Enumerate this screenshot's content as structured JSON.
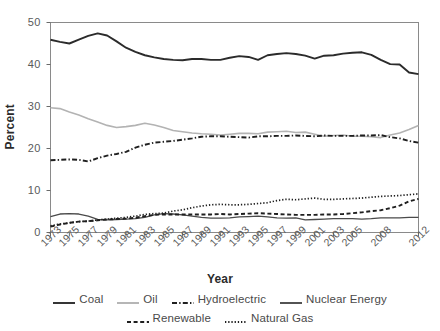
{
  "chart_data": {
    "type": "line",
    "title": "",
    "xlabel": "Year",
    "ylabel": "Percent",
    "xlim": [
      1973,
      2012
    ],
    "ylim": [
      0,
      50
    ],
    "ytick_values": [
      0,
      10,
      20,
      30,
      40,
      50
    ],
    "ytick_labels": [
      "0",
      "10",
      "20",
      "30",
      "40",
      "50"
    ],
    "xtick_labels": [
      "1973",
      "1975",
      "1977",
      "1979",
      "1981",
      "1983",
      "1985",
      "1987",
      "1989",
      "1991",
      "1993",
      "1995",
      "1997",
      "1999",
      "2001",
      "2003",
      "2005",
      "2008",
      "2012"
    ],
    "xtick_values": [
      1973,
      1975,
      1977,
      1979,
      1981,
      1983,
      1985,
      1987,
      1989,
      1991,
      1993,
      1995,
      1997,
      1999,
      2001,
      2003,
      2005,
      2008,
      2012
    ],
    "x": [
      1973,
      1974,
      1975,
      1976,
      1977,
      1978,
      1979,
      1980,
      1981,
      1982,
      1983,
      1984,
      1985,
      1986,
      1987,
      1988,
      1989,
      1990,
      1991,
      1992,
      1993,
      1994,
      1995,
      1996,
      1997,
      1998,
      1999,
      2000,
      2001,
      2002,
      2003,
      2004,
      2005,
      2006,
      2007,
      2008,
      2009,
      2010,
      2011,
      2012
    ],
    "grid": false,
    "legend_position": "bottom",
    "series": [
      {
        "name": "Coal",
        "style": "solid",
        "color": "#2b2b2b",
        "width": 1.9,
        "values": [
          45.9,
          45.4,
          45.0,
          45.9,
          46.8,
          47.4,
          46.9,
          45.5,
          44.0,
          43.0,
          42.2,
          41.7,
          41.3,
          41.1,
          41.0,
          41.3,
          41.3,
          41.1,
          41.1,
          41.6,
          42.0,
          41.8,
          41.1,
          42.2,
          42.5,
          42.7,
          42.5,
          42.1,
          41.4,
          42.1,
          42.2,
          42.6,
          42.8,
          42.9,
          42.3,
          41.1,
          40.1,
          40.0,
          38.1,
          37.7
        ]
      },
      {
        "name": "Oil",
        "style": "solid",
        "color": "#b3b3b3",
        "width": 1.6,
        "values": [
          29.7,
          29.5,
          28.7,
          28.0,
          27.1,
          26.3,
          25.5,
          25.0,
          25.2,
          25.5,
          26.0,
          25.6,
          25.0,
          24.3,
          24.0,
          23.7,
          23.5,
          23.4,
          23.2,
          23.4,
          23.6,
          23.6,
          23.5,
          23.9,
          24.0,
          24.1,
          23.8,
          23.9,
          23.4,
          22.9,
          23.1,
          23.2,
          22.9,
          22.9,
          22.8,
          22.6,
          23.2,
          23.7,
          24.5,
          25.5
        ]
      },
      {
        "name": "Hydroelectric",
        "style": "dashdot",
        "color": "#1f1f1f",
        "width": 1.9,
        "values": [
          17.2,
          17.3,
          17.4,
          17.3,
          16.9,
          17.7,
          18.3,
          18.7,
          19.2,
          20.2,
          20.9,
          21.4,
          21.6,
          21.8,
          22.1,
          22.4,
          22.8,
          22.9,
          22.9,
          22.8,
          22.7,
          22.6,
          22.9,
          22.9,
          23.0,
          23.0,
          23.1,
          23.0,
          22.9,
          23.1,
          23.0,
          23.0,
          23.0,
          23.1,
          23.1,
          23.2,
          22.7,
          22.4,
          21.8,
          21.4
        ]
      },
      {
        "name": "Nuclear Energy",
        "style": "solid",
        "color": "#4a4a4a",
        "width": 1.3,
        "values": [
          3.8,
          4.4,
          4.5,
          4.4,
          3.9,
          3.1,
          3.0,
          3.1,
          3.2,
          3.3,
          3.6,
          4.2,
          4.5,
          4.4,
          4.2,
          3.9,
          3.6,
          3.4,
          3.4,
          3.5,
          3.7,
          3.8,
          3.9,
          3.7,
          3.5,
          3.4,
          3.5,
          3.0,
          3.1,
          3.2,
          3.3,
          3.3,
          3.3,
          3.2,
          3.3,
          3.5,
          3.5,
          3.5,
          3.6,
          3.6
        ]
      },
      {
        "name": "Renewable",
        "style": "dashed",
        "color": "#1f1f1f",
        "width": 1.9,
        "values": [
          1.4,
          1.9,
          2.3,
          2.6,
          2.7,
          2.9,
          3.1,
          3.2,
          3.3,
          3.5,
          3.9,
          4.2,
          4.3,
          4.3,
          4.3,
          4.3,
          4.3,
          4.3,
          4.4,
          4.3,
          4.4,
          4.5,
          4.6,
          4.5,
          4.4,
          4.3,
          4.2,
          4.2,
          4.2,
          4.3,
          4.3,
          4.4,
          4.6,
          4.8,
          5.1,
          5.3,
          5.8,
          6.4,
          7.4,
          8.0
        ]
      },
      {
        "name": "Natural Gas",
        "style": "dotted",
        "color": "#1f1f1f",
        "width": 1.7,
        "values": [
          1.6,
          2.0,
          2.3,
          2.6,
          2.7,
          3.0,
          3.2,
          3.4,
          3.6,
          3.9,
          4.3,
          4.5,
          4.6,
          5.1,
          5.4,
          5.9,
          6.3,
          6.6,
          6.7,
          6.6,
          6.6,
          6.7,
          6.9,
          7.1,
          7.6,
          7.9,
          7.8,
          8.0,
          8.2,
          7.9,
          7.9,
          8.0,
          8.1,
          8.2,
          8.4,
          8.6,
          8.7,
          8.8,
          9.0,
          9.2
        ]
      }
    ]
  },
  "axes": {
    "ylabel": "Percent",
    "xlabel": "Year"
  },
  "legend": {
    "row1": [
      {
        "label": "Coal",
        "style": "solid",
        "color": "#2b2b2b"
      },
      {
        "label": "Oil",
        "style": "solid",
        "color": "#b3b3b3"
      },
      {
        "label": "Hydroelectric",
        "style": "dashdot",
        "color": "#1f1f1f"
      },
      {
        "label": "Nuclear Energy",
        "style": "solid",
        "color": "#4a4a4a"
      }
    ],
    "row2": [
      {
        "label": "Renewable",
        "style": "dashed",
        "color": "#1f1f1f"
      },
      {
        "label": "Natural Gas",
        "style": "dotted",
        "color": "#1f1f1f"
      }
    ]
  }
}
